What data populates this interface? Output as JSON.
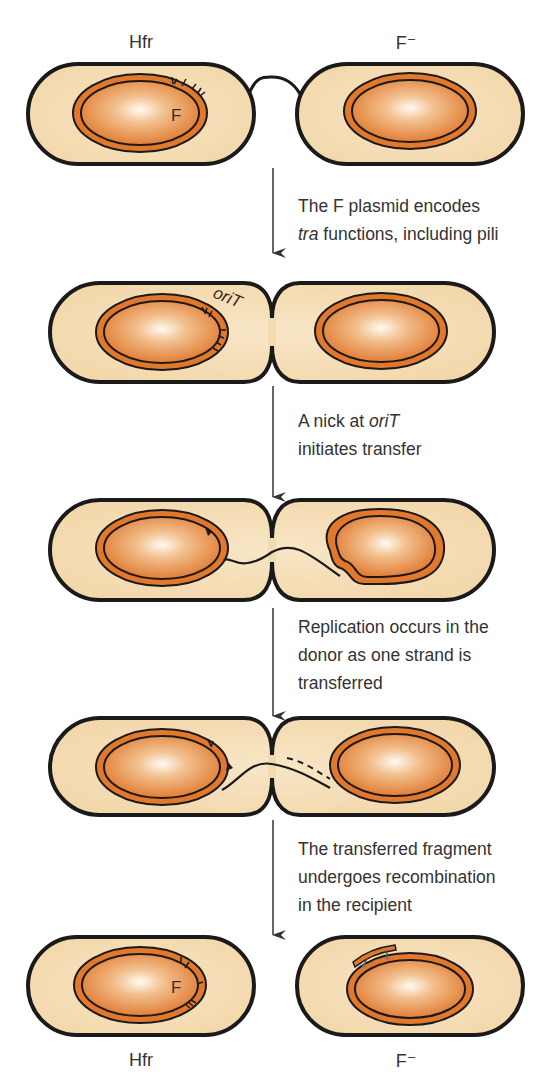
{
  "labels": {
    "top_left": "Hfr",
    "top_right": "F⁻",
    "bottom_left": "Hfr",
    "bottom_right": "F⁻",
    "plasmid_marker": "F",
    "plasmid_marker_final": "F",
    "origin_label": "oriT"
  },
  "steps": [
    {
      "line1_italic": "",
      "line1": "The F plasmid encodes",
      "line2_italic": "tra",
      "line2": " functions, including pili",
      "line3": ""
    },
    {
      "line1_prefix": "A nick at ",
      "line1_italic": "oriT",
      "line2": "initiates transfer",
      "line3": ""
    },
    {
      "line1": "Replication occurs in the",
      "line2": "donor as one strand is",
      "line3": "transferred"
    },
    {
      "line1": "The transferred fragment",
      "line2": "undergoes recombination",
      "line3": "in the recipient"
    }
  ],
  "colors": {
    "cell_fill": "#f6dfba",
    "cell_outline": "#1a1a1a",
    "ring_orange": "#e2782c",
    "nucleoid_edge": "#df7428",
    "nucleoid_center": "#fff8ef",
    "arrow": "#333333"
  }
}
